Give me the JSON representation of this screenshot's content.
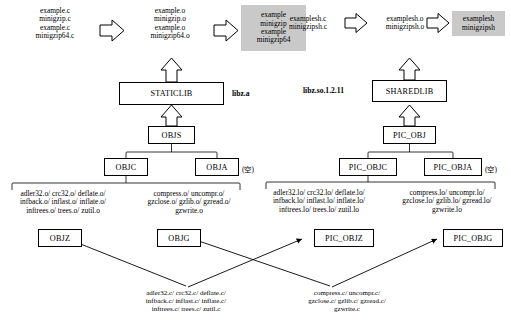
{
  "diagram": {
    "static_chain": {
      "sources": "example.c\nminigzip.c\nexample.c\nminigzip64.c",
      "objects": "example.o\nminigzip.o\nexample.o\nminigzip64.o",
      "binaries": "example\nminigzip\nexample\nminigzip64",
      "lib_box": "STATICLIB",
      "lib_label": "libz.a",
      "objs_box": "OBJS",
      "objc_box": "OBJC",
      "obja_box": "OBJA",
      "obja_note": "(空)",
      "objz_box": "OBJZ",
      "objg_box": "OBJG",
      "objz_files": "adler32.o/ crc32.o/ deflate.o/\ninfback.o/ inflast.o/ inflate.o/\ninftrees.o/ trees.o/ zutil.o",
      "objg_files": "compress.o/ uncompr.o/\ngzclose.o/ gzlib.o/ gzread.o/\ngzwrite.o",
      "objz_sources": "adler32.c/ crc32.c/ deflate.c/\ninfback.c/ inflast.c/ inflate.c/\ninftrees.c/ trees.c/ zutil.c",
      "objg_sources": "compress.c/ uncompr.c/\ngzclose.c/ gzlib.c/ gzread.c/\ngzwrite.c"
    },
    "shared_chain": {
      "sources": "examplesh.c\nminigzipsh.c",
      "objects": "examplesh.o\nminigzipsh.o",
      "binaries": "examplesh\nminigzipsh",
      "lib_box": "SHAREDLIB",
      "lib_label": "libz.so.1.2.11",
      "picobj_box": "PIC_OBJ",
      "picobjc_box": "PIC_OBJC",
      "picobja_box": "PIC_OBJA",
      "picobja_note": "(空)",
      "picobjz_box": "PIC_OBJZ",
      "picobjg_box": "PIC_OBJG",
      "picobjz_files": "adler32.lo/ crc32.lo/ deflate.lo/\ninfback.lo/ inflast.lo/ inflate.lo/\ninftrees.lo/ trees.lo/ zutil.lo",
      "picobjg_files": "compress.lo/ uncompr.lo/\ngzclose.lo/ gzlib.lo/ gzread.lo/\ngzwrite.lo"
    },
    "colors": {
      "shade": "#c9c9c9",
      "line": "#000000",
      "background": "#ffffff"
    }
  }
}
